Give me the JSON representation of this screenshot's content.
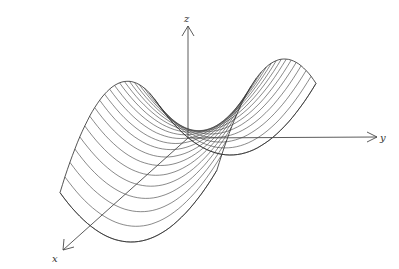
{
  "figure": {
    "axes": {
      "x_label": "x",
      "y_label": "y",
      "z_label": "z"
    },
    "projection": {
      "origin": [
        188,
        138
      ],
      "x_dir": [
        -0.98,
        0.86
      ],
      "y_dir": [
        1.55,
        -0.22
      ],
      "z_dir": [
        0,
        -1.0
      ]
    },
    "surface": {
      "equation": "z = y^2 - x^2",
      "x_range": [
        -1,
        1
      ],
      "y_range": [
        -1,
        1
      ],
      "scale": 92,
      "z_scale": 60,
      "level_lines": 20
    },
    "colors": {
      "line": "#3a3a3a",
      "background": "#ffffff"
    }
  }
}
